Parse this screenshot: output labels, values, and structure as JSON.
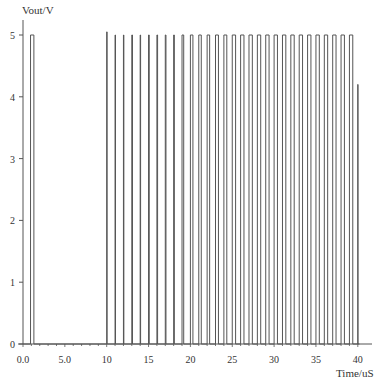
{
  "chart_data": {
    "type": "line",
    "title": "",
    "xlabel": "Time/uS",
    "ylabel": "Vout/V",
    "xlim": [
      0,
      41
    ],
    "ylim": [
      0,
      5.2
    ],
    "x_ticks": [
      0,
      5,
      10,
      15,
      20,
      25,
      30,
      35,
      40
    ],
    "x_tick_labels": [
      "0.0",
      "5.0",
      "10",
      "15",
      "20",
      "25",
      "30",
      "35",
      "40"
    ],
    "y_ticks": [
      0,
      1,
      2,
      3,
      4,
      5
    ],
    "y_tick_labels": [
      "0",
      "1",
      "2",
      "3",
      "4",
      "5"
    ],
    "grid": false,
    "legend": null,
    "series": [
      {
        "name": "Vout",
        "color": "#555555",
        "description": "Pulse train: one pulse near 1uS, then pulses roughly every 1uS from 10uS to 40uS at ~5V amplitude",
        "pulses": [
          {
            "start": 0.9,
            "end": 1.3,
            "high": 5.0
          },
          {
            "start": 10.0,
            "end": 10.05,
            "high": 5.05
          },
          {
            "start": 11.0,
            "end": 11.05,
            "high": 5.0
          },
          {
            "start": 12.0,
            "end": 12.05,
            "high": 5.0
          },
          {
            "start": 13.0,
            "end": 13.08,
            "high": 5.0
          },
          {
            "start": 14.0,
            "end": 14.05,
            "high": 5.0
          },
          {
            "start": 15.0,
            "end": 15.08,
            "high": 5.0
          },
          {
            "start": 16.0,
            "end": 16.08,
            "high": 5.0
          },
          {
            "start": 17.0,
            "end": 17.08,
            "high": 5.0
          },
          {
            "start": 18.0,
            "end": 18.08,
            "high": 5.0
          },
          {
            "start": 19.0,
            "end": 19.2,
            "high": 5.0
          },
          {
            "start": 20.0,
            "end": 20.3,
            "high": 5.0
          },
          {
            "start": 21.0,
            "end": 21.3,
            "high": 5.0
          },
          {
            "start": 22.0,
            "end": 22.3,
            "high": 5.0
          },
          {
            "start": 23.0,
            "end": 23.35,
            "high": 5.0
          },
          {
            "start": 24.0,
            "end": 24.35,
            "high": 5.0
          },
          {
            "start": 25.0,
            "end": 25.4,
            "high": 5.0
          },
          {
            "start": 26.0,
            "end": 26.4,
            "high": 5.0
          },
          {
            "start": 27.0,
            "end": 27.4,
            "high": 5.0
          },
          {
            "start": 28.0,
            "end": 28.4,
            "high": 5.0
          },
          {
            "start": 29.0,
            "end": 29.4,
            "high": 5.0
          },
          {
            "start": 30.0,
            "end": 30.4,
            "high": 5.0
          },
          {
            "start": 31.0,
            "end": 31.4,
            "high": 5.0
          },
          {
            "start": 32.0,
            "end": 32.4,
            "high": 5.0
          },
          {
            "start": 33.0,
            "end": 33.4,
            "high": 5.0
          },
          {
            "start": 34.0,
            "end": 34.4,
            "high": 5.0
          },
          {
            "start": 35.0,
            "end": 35.4,
            "high": 5.0
          },
          {
            "start": 36.0,
            "end": 36.4,
            "high": 5.0
          },
          {
            "start": 37.0,
            "end": 37.4,
            "high": 5.0
          },
          {
            "start": 38.0,
            "end": 38.4,
            "high": 5.0
          },
          {
            "start": 39.0,
            "end": 39.4,
            "high": 5.0
          },
          {
            "start": 40.0,
            "end": 40.02,
            "high": 4.2
          }
        ],
        "low": 0.0
      }
    ]
  },
  "layout": {
    "px_x0": 23,
    "px_per_unit_x": 8.37,
    "px_y0": 344,
    "px_per_unit_y": 61.8,
    "axis_end_x": 372
  }
}
